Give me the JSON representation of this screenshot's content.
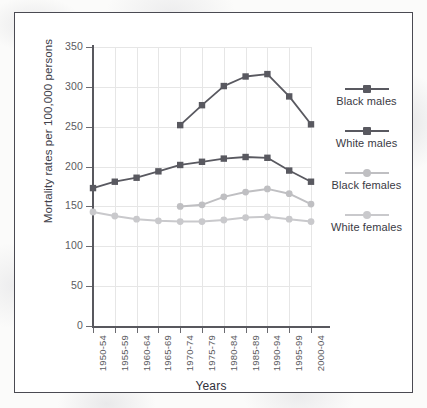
{
  "chart_data": {
    "type": "line",
    "title": "",
    "xlabel": "Years",
    "ylabel": "Mortality rates per 100,000 persons",
    "categories": [
      "1950-54",
      "1955-59",
      "1960-64",
      "1965-69",
      "1970-74",
      "1975-79",
      "1980-84",
      "1985-89",
      "1990-94",
      "1995-99",
      "2000-04"
    ],
    "ylim": [
      0,
      350
    ],
    "yticks": [
      0,
      50,
      100,
      150,
      200,
      250,
      300,
      350
    ],
    "grid": true,
    "legend_position": "right",
    "series": [
      {
        "name": "Black males",
        "color": "#595960",
        "marker": "square",
        "values": [
          null,
          null,
          null,
          null,
          252,
          277,
          301,
          313,
          316,
          288,
          253
        ]
      },
      {
        "name": "White males",
        "color": "#595960",
        "marker": "square",
        "values": [
          173,
          181,
          186,
          194,
          202,
          206,
          210,
          212,
          211,
          195,
          181
        ]
      },
      {
        "name": "Black females",
        "color": "#bfbfc2",
        "marker": "circle",
        "values": [
          null,
          null,
          null,
          null,
          150,
          152,
          162,
          168,
          172,
          166,
          153
        ]
      },
      {
        "name": "White females",
        "color": "#c9c9cc",
        "marker": "circle",
        "values": [
          143,
          138,
          134,
          132,
          131,
          131,
          133,
          136,
          137,
          134,
          131
        ]
      }
    ]
  },
  "legend": {
    "entries": [
      {
        "label": "Black males"
      },
      {
        "label": "White males"
      },
      {
        "label": "Black females"
      },
      {
        "label": "White females"
      }
    ]
  },
  "colors": {
    "dark_series": "#595960",
    "light_series": "#c4c4c7",
    "axis": "#58585e",
    "grid": "#e6e6e6",
    "frame_border": "#4a4a52",
    "plot_background": "#ffffff"
  }
}
